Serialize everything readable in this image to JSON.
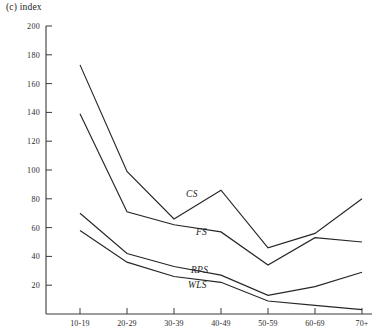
{
  "chart_data": {
    "type": "line",
    "title": "(c) index",
    "xlabel": "",
    "ylabel": "index",
    "categories": [
      "10-19",
      "20-29",
      "30-39",
      "40-49",
      "50-59",
      "60-69",
      "70+"
    ],
    "ylim": [
      0,
      200
    ],
    "ytick_step": 20,
    "yticks": [
      0,
      20,
      40,
      60,
      80,
      100,
      120,
      140,
      160,
      180,
      200
    ],
    "ytick_labels": [
      "0",
      "20",
      "40",
      "60",
      "80",
      "100",
      "120",
      "140",
      "160",
      "180",
      "200"
    ],
    "grid": false,
    "legend_position": "inline-labels",
    "series": [
      {
        "name": "CS",
        "label": "CS",
        "values": [
          173,
          99,
          66,
          86,
          46,
          56,
          80
        ]
      },
      {
        "name": "FS",
        "label": "FS",
        "values": [
          139,
          71,
          62,
          57,
          34,
          53,
          50
        ]
      },
      {
        "name": "RPS",
        "label": "RPS",
        "values": [
          70,
          42,
          33,
          27,
          13,
          19,
          29
        ]
      },
      {
        "name": "WLS",
        "label": "WLS",
        "values": [
          58,
          36,
          26,
          22,
          9,
          6,
          3
        ]
      }
    ]
  },
  "axis": {
    "y_top_label": "200",
    "y_bottom_label": "0"
  }
}
